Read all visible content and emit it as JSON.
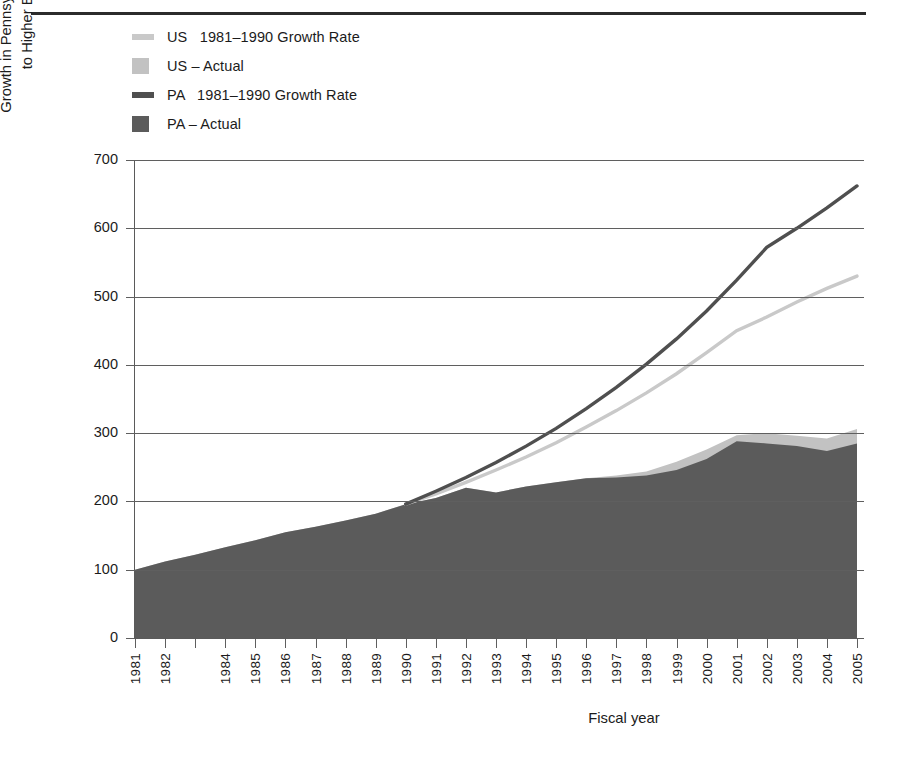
{
  "colors": {
    "us_line": "#c9c9c9",
    "us_area": "#c2c2c2",
    "pa_line": "#4f4f4f",
    "pa_area": "#5b5b5b",
    "axis": "#5f5f5f",
    "rule": "#2b2b2b",
    "text": "#1b1b1b"
  },
  "legend": {
    "items": [
      {
        "label": "US   1981–1990 Growth Rate",
        "swatch": "line",
        "color": "#c9c9c9",
        "name": "legend-us-growth-rate"
      },
      {
        "label": "US – Actual",
        "swatch": "block",
        "color": "#c2c2c2",
        "name": "legend-us-actual"
      },
      {
        "label": "PA   1981–1990 Growth Rate",
        "swatch": "line",
        "color": "#4f4f4f",
        "name": "legend-pa-growth-rate"
      },
      {
        "label": "PA – Actual",
        "swatch": "block",
        "color": "#5b5b5b",
        "name": "legend-pa-actual"
      }
    ]
  },
  "axis_titles": {
    "y_line1": "Growth in Pennsylvania and National Appropriations",
    "y_line2": "to Higher Education(Index 1981 = 100)",
    "x": "Fiscal year"
  },
  "chart_data": {
    "type": "area",
    "title": "",
    "xlabel": "Fiscal year",
    "ylabel": "Growth in Pennsylvania and National Appropriations to Higher Education(Index 1981 = 100)",
    "ylim": [
      0,
      700
    ],
    "yticks": [
      0,
      100,
      200,
      300,
      400,
      500,
      600,
      700
    ],
    "grid": true,
    "legend_position": "top-left",
    "x_tick_labels": [
      "1981",
      "1982",
      "1984",
      "1985",
      "1986",
      "1987",
      "1988",
      "1989",
      "1990",
      "1991",
      "1992",
      "1993",
      "1994",
      "1995",
      "1996",
      "1997",
      "1998",
      "1999",
      "2000",
      "2001",
      "2002",
      "2003",
      "2004",
      "2005"
    ],
    "x": [
      1981,
      1982,
      1983,
      1984,
      1985,
      1986,
      1987,
      1988,
      1989,
      1990,
      1991,
      1992,
      1993,
      1994,
      1995,
      1996,
      1997,
      1998,
      1999,
      2000,
      2001,
      2002,
      2003,
      2004,
      2005
    ],
    "series": [
      {
        "name": "PA – Actual",
        "kind": "area",
        "color": "#5b5b5b",
        "values": [
          100,
          112,
          122,
          133,
          143,
          155,
          163,
          172,
          182,
          196,
          205,
          220,
          213,
          222,
          228,
          234,
          235,
          238,
          246,
          262,
          288,
          285,
          281,
          274,
          285
        ]
      },
      {
        "name": "US – Actual",
        "kind": "area",
        "color": "#c2c2c2",
        "values": [
          100,
          112,
          122,
          133,
          143,
          155,
          163,
          172,
          182,
          196,
          205,
          220,
          213,
          222,
          228,
          234,
          238,
          244,
          258,
          276,
          297,
          300,
          296,
          292,
          306
        ]
      },
      {
        "name": "PA  1981–1990 Growth Rate",
        "kind": "line",
        "color": "#4f4f4f",
        "values": [
          null,
          null,
          null,
          null,
          null,
          null,
          null,
          null,
          null,
          196,
          215,
          235,
          257,
          281,
          307,
          336,
          367,
          401,
          438,
          479,
          524,
          572,
          600,
          630,
          662
        ]
      },
      {
        "name": "US  1981–1990 Growth Rate",
        "kind": "line",
        "color": "#c9c9c9",
        "values": [
          null,
          null,
          null,
          null,
          null,
          null,
          null,
          null,
          null,
          196,
          211,
          228,
          246,
          265,
          286,
          309,
          333,
          359,
          387,
          418,
          450,
          470,
          492,
          512,
          530
        ]
      }
    ]
  }
}
